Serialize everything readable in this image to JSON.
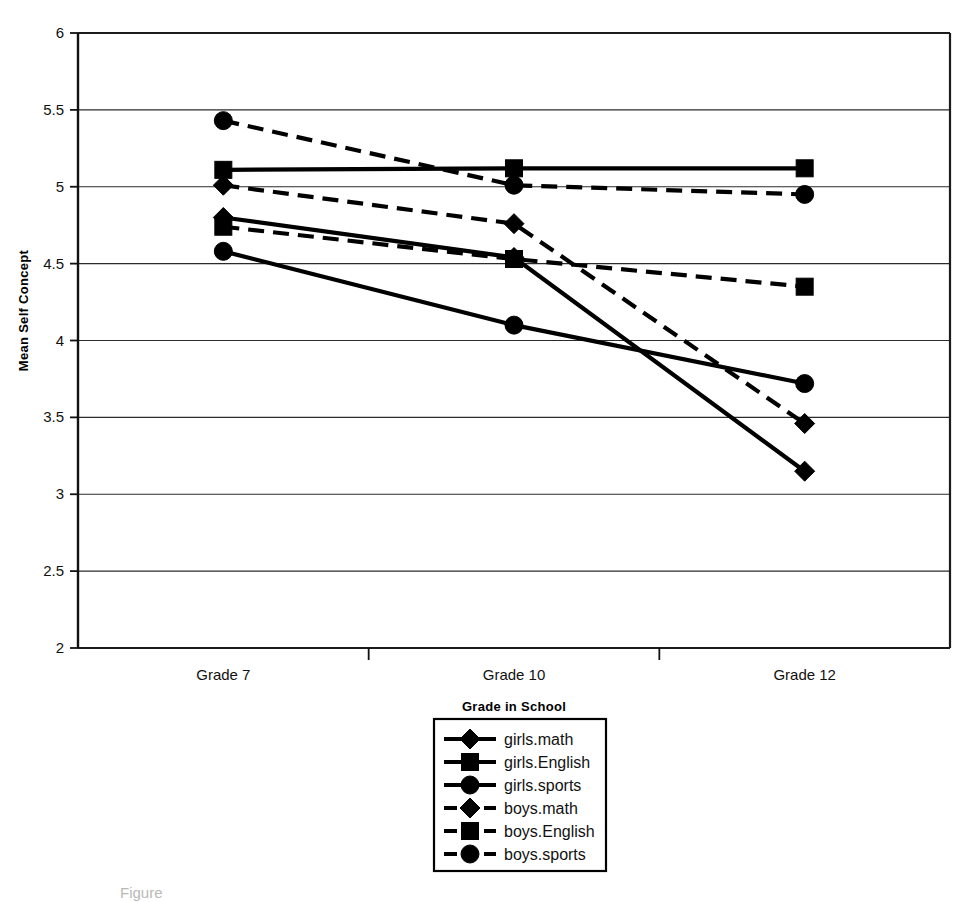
{
  "chart_data": {
    "type": "line",
    "title": "",
    "xlabel": "Grade in School",
    "ylabel": "Mean Self Concept",
    "categories": [
      "Grade 7",
      "Grade 10",
      "Grade 12"
    ],
    "ylim": [
      2,
      6
    ],
    "yticks": [
      "2",
      "2.5",
      "3",
      "3.5",
      "4",
      "4.5",
      "5",
      "5.5",
      "6"
    ],
    "ytick_values": [
      2,
      2.5,
      3,
      3.5,
      4,
      4.5,
      5,
      5.5,
      6
    ],
    "grid": "horizontal",
    "legend_position": "bottom-center",
    "series": [
      {
        "name": "girls.math",
        "style": "solid",
        "marker": "diamond",
        "values": [
          4.8,
          4.54,
          3.15
        ]
      },
      {
        "name": "girls.English",
        "style": "solid",
        "marker": "square",
        "values": [
          5.11,
          5.12,
          5.12
        ]
      },
      {
        "name": "girls.sports",
        "style": "solid",
        "marker": "circle",
        "values": [
          4.58,
          4.1,
          3.72
        ]
      },
      {
        "name": "boys.math",
        "style": "dashed",
        "marker": "diamond",
        "values": [
          5.01,
          4.76,
          3.46
        ]
      },
      {
        "name": "boys.English",
        "style": "dashed",
        "marker": "square",
        "values": [
          4.74,
          4.53,
          4.35
        ]
      },
      {
        "name": "boys.sports",
        "style": "dashed",
        "marker": "circle",
        "values": [
          5.43,
          5.01,
          4.95
        ]
      }
    ]
  },
  "axes": {
    "y_title": "Mean Self Concept",
    "x_title": "Grade in School"
  },
  "legend": {
    "items": [
      {
        "label": "girls.math"
      },
      {
        "label": "girls.English"
      },
      {
        "label": "girls.sports"
      },
      {
        "label": "boys.math"
      },
      {
        "label": "boys.English"
      },
      {
        "label": "boys.sports"
      }
    ]
  },
  "caption": {
    "text": "Figure"
  },
  "colors": {
    "line": "#000000",
    "grid": "#2b2b2b",
    "background": "#ffffff"
  }
}
